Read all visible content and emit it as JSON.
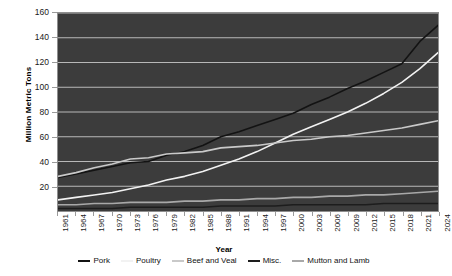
{
  "chart_data": {
    "type": "line",
    "title": "",
    "xlabel": "Year",
    "ylabel": "Million Metric Tons",
    "xlim": [
      1961,
      2024
    ],
    "ylim": [
      0,
      160
    ],
    "grid": true,
    "legend_position": "bottom",
    "plot_background": "#3c3c3c",
    "gridline_color": "#b9b9b9",
    "x_tick_labels": [
      "1961",
      "1964",
      "1967",
      "1970",
      "1973",
      "1976",
      "1979",
      "1982",
      "1985",
      "1988",
      "1991",
      "1994",
      "1997",
      "2000",
      "2003",
      "2006",
      "2009",
      "2012",
      "2015",
      "2018",
      "2021",
      "2024"
    ],
    "y_tick_labels": [
      "20",
      "40",
      "60",
      "80",
      "100",
      "120",
      "140",
      "160"
    ],
    "y_ticks": [
      20,
      40,
      60,
      80,
      100,
      120,
      140,
      160
    ],
    "x": [
      1961,
      1964,
      1967,
      1970,
      1973,
      1976,
      1979,
      1982,
      1985,
      1988,
      1991,
      1994,
      1997,
      2000,
      2003,
      2006,
      2009,
      2012,
      2015,
      2018,
      2021,
      2024
    ],
    "series": [
      {
        "name": "Pork",
        "color": "#131313",
        "values": [
          27,
          30,
          33,
          36,
          39,
          40,
          45,
          48,
          53,
          60,
          64,
          69,
          74,
          79,
          86,
          92,
          99,
          105,
          112,
          119,
          137,
          150
        ]
      },
      {
        "name": "Poultry",
        "color": "#f2f2f2",
        "values": [
          9,
          11,
          13,
          15,
          18,
          21,
          25,
          28,
          32,
          37,
          42,
          48,
          55,
          62,
          68,
          74,
          80,
          87,
          95,
          104,
          115,
          128
        ]
      },
      {
        "name": "Beef and Veal",
        "color": "#c9c9c9",
        "values": [
          28,
          31,
          35,
          38,
          42,
          43,
          46,
          47,
          48,
          51,
          52,
          53,
          55,
          57,
          58,
          60,
          61,
          63,
          65,
          67,
          70,
          73
        ]
      },
      {
        "name": "Misc.",
        "color": "#1d1d1d",
        "values": [
          2,
          2,
          2,
          2,
          3,
          3,
          3,
          3,
          3,
          4,
          4,
          4,
          4,
          5,
          5,
          5,
          5,
          5,
          6,
          6,
          6,
          6
        ]
      },
      {
        "name": "Mutton and Lamb",
        "color": "#a8a8a8",
        "values": [
          5,
          5,
          6,
          6,
          7,
          7,
          7,
          8,
          8,
          9,
          9,
          10,
          10,
          11,
          11,
          12,
          12,
          13,
          13,
          14,
          15,
          16
        ]
      }
    ]
  }
}
